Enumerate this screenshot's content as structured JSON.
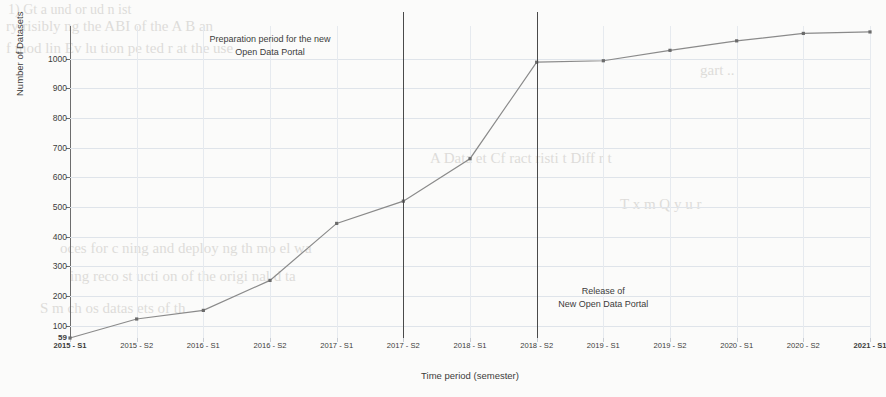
{
  "chart_data": {
    "type": "line",
    "title": "",
    "xlabel": "Time period (semester)",
    "ylabel": "Number of Datasets",
    "categories": [
      "2015 - S1",
      "2015 - S2",
      "2016 - S1",
      "2016 - S2",
      "2017 - S1",
      "2017 - S2",
      "2018 - S1",
      "2018 - S2",
      "2019 - S1",
      "2019 - S2",
      "2020 - S1",
      "2020 - S2",
      "2021 - S1"
    ],
    "series": [
      {
        "name": "Number of Datasets",
        "values": [
          59,
          123,
          152,
          253,
          445,
          520,
          663,
          988,
          993,
          1028,
          1060,
          1085,
          1090
        ]
      }
    ],
    "ylim": [
      59,
      1110
    ],
    "yticks": [
      100,
      200,
      300,
      400,
      500,
      600,
      700,
      800,
      900,
      1000
    ],
    "ytick_labels": [
      "100",
      "200",
      "300",
      "400",
      "500",
      "600",
      "700",
      "800",
      "900",
      "1000"
    ],
    "baseline_tick": "59",
    "grid": true,
    "legend": "none",
    "line_color": "#8a8a8a",
    "marker_color": "#6b6b6b",
    "annotations": [
      {
        "name": "preparation-period",
        "lines": [
          "Preparation period for the new",
          "Open Data Portal"
        ],
        "text": "Preparation period for the new Open Data Portal",
        "at_category": "2017 - S2",
        "vline": true,
        "label_x_category": "2016 - S2",
        "label_value": 1060
      },
      {
        "name": "portal-release",
        "lines": [
          "Release of",
          "New Open Data Portal"
        ],
        "text": "Release of New Open Data Portal",
        "at_category": "2018 - S2",
        "vline": true,
        "label_x_category": "2019 - S1",
        "label_value": 210
      }
    ]
  },
  "ghost_text": {
    "lines": [
      "1)  Gt  a   und   or ud   n   ist",
      "ry risibly   ng the  ABI   of the   A B  an",
      "f  mod lin   Ev lu  tion  pe  ted   r at the  use",
      "gart ..",
      "A   Data   et Cf  ract  risti  t  Diff  r    t",
      "T   x m          Q  y     u   r",
      "oces  for  c  ning  and  deploy   ng  th  mo  el  wa",
      "ing  reco  st  ucti  on  of  the  origi  nal  d   ta",
      "S     m    ch     os       datas     ets     of     th"
    ]
  }
}
